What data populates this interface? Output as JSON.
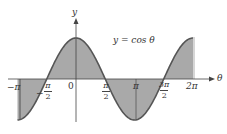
{
  "diagram": {
    "equation_label": "y = cos θ",
    "axes": {
      "x_label": "θ",
      "y_label": "y"
    },
    "tick_labels": {
      "neg_pi": "−π",
      "neg_pi_over_2_sign": "−",
      "neg_pi_over_2_num": "π",
      "neg_pi_over_2_den": "2",
      "zero": "0",
      "pi_over_2_num": "π",
      "pi_over_2_den": "2",
      "pi": "π",
      "three_pi_over_2_num": "3π",
      "three_pi_over_2_den": "2",
      "two_pi": "2π"
    },
    "colors": {
      "fill": "#a9a9a9",
      "curve": "#555555",
      "axis": "#444444"
    }
  },
  "chart_data": {
    "type": "area",
    "title": "y = cos θ",
    "xlabel": "θ",
    "ylabel": "y",
    "function": "cos(theta)",
    "x_range": [
      -3.1416,
      6.2832
    ],
    "ylim": [
      -1,
      1
    ],
    "shaded_region": "between curve and θ-axis from −π to 2π",
    "x_ticks": [
      "−π",
      "−π/2",
      "0",
      "π/2",
      "π",
      "3π/2",
      "2π"
    ],
    "x_tick_values": [
      -3.1416,
      -1.5708,
      0,
      1.5708,
      3.1416,
      4.7124,
      6.2832
    ],
    "vertical_lines_at": [
      "−π",
      "π"
    ],
    "grid": false
  }
}
